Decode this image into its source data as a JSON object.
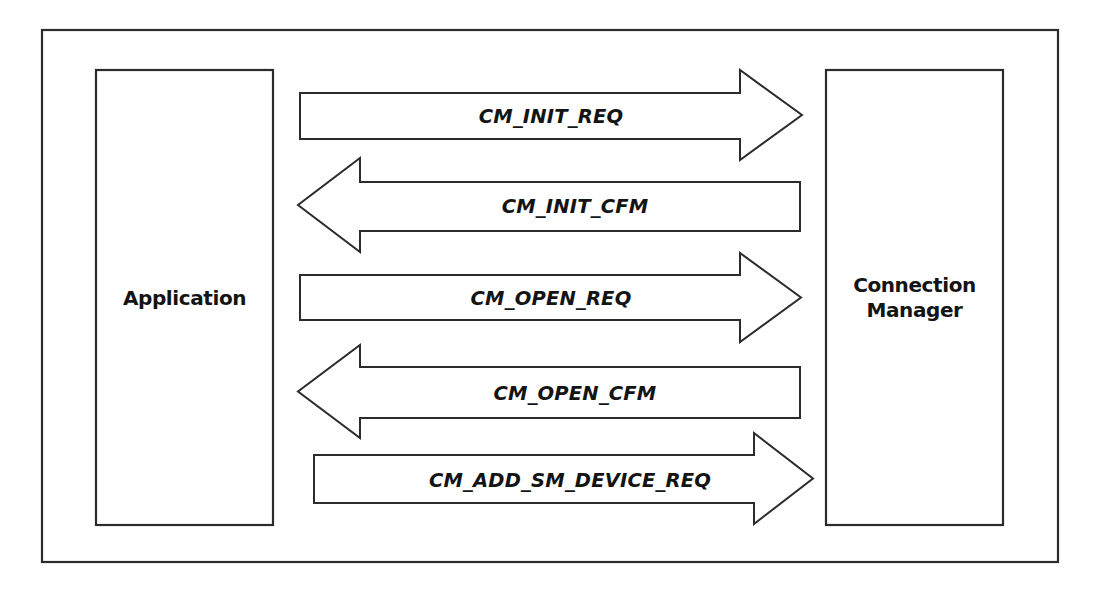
{
  "diagram": {
    "type": "message-sequence-diagram",
    "background_color": "#ffffff",
    "line_color": "#2b2b2b",
    "text_color": "#141414",
    "frame": {
      "x": 42,
      "y": 30,
      "width": 1016,
      "height": 532
    },
    "participants": [
      {
        "id": "application",
        "label": "Application",
        "label_lines": [
          "Application"
        ],
        "x": 96,
        "y": 70,
        "width": 177,
        "height": 455
      },
      {
        "id": "connection-manager",
        "label": "Connection Manager",
        "label_lines": [
          "Connection",
          "Manager"
        ],
        "x": 826,
        "y": 70,
        "width": 177,
        "height": 455
      }
    ],
    "messages": [
      {
        "index": 1,
        "label": "CM_INIT_REQ",
        "direction": "right",
        "from": "application",
        "to": "connection-manager",
        "shaft_x1": 300,
        "shaft_x2": 740,
        "head_tip_x": 802,
        "shaft_y1": 93,
        "shaft_y2": 139,
        "head_y1": 70,
        "head_y2": 160,
        "label_x": 551,
        "label_y": 123
      },
      {
        "index": 2,
        "label": "CM_INIT_CFM",
        "direction": "left",
        "from": "connection-manager",
        "to": "application",
        "shaft_x1": 800,
        "shaft_x2": 360,
        "head_tip_x": 298,
        "shaft_y1": 182,
        "shaft_y2": 231,
        "head_y1": 158,
        "head_y2": 252,
        "label_x": 575,
        "label_y": 213
      },
      {
        "index": 3,
        "label": "CM_OPEN_REQ",
        "direction": "right",
        "from": "application",
        "to": "connection-manager",
        "shaft_x1": 300,
        "shaft_x2": 740,
        "head_tip_x": 801,
        "shaft_y1": 275,
        "shaft_y2": 320,
        "head_y1": 253,
        "head_y2": 342,
        "label_x": 551,
        "label_y": 305
      },
      {
        "index": 4,
        "label": "CM_OPEN_CFM",
        "direction": "left",
        "from": "connection-manager",
        "to": "application",
        "shaft_x1": 800,
        "shaft_x2": 360,
        "head_tip_x": 298,
        "shaft_y1": 367,
        "shaft_y2": 418,
        "head_y1": 345,
        "head_y2": 438,
        "label_x": 575,
        "label_y": 400
      },
      {
        "index": 5,
        "label": "CM_ADD_SM_DEVICE_REQ",
        "direction": "right",
        "from": "application",
        "to": "connection-manager",
        "shaft_x1": 314,
        "shaft_x2": 754,
        "head_tip_x": 813,
        "shaft_y1": 455,
        "shaft_y2": 503,
        "head_y1": 433,
        "head_y2": 524,
        "label_x": 570,
        "label_y": 487
      }
    ]
  }
}
